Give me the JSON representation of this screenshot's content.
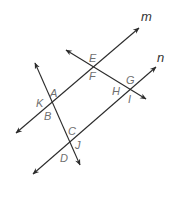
{
  "diagram": {
    "type": "geometry-parallel-lines-transversals",
    "line_labels": {
      "m": "m",
      "n": "n"
    },
    "point_labels": {
      "A": "A",
      "B": "B",
      "C": "C",
      "D": "D",
      "E": "E",
      "F": "F",
      "G": "G",
      "H": "H",
      "I": "I",
      "J": "J",
      "K": "K"
    },
    "colors": {
      "line": "#2b2b2b",
      "point_label": "#6f6f6f",
      "line_label": "#333333"
    }
  }
}
